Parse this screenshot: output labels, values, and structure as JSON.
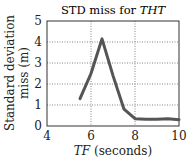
{
  "chart_data": {
    "type": "line",
    "title": "STD miss for THT",
    "title_plain": "STD miss for ",
    "title_italic": "THT",
    "xlabel": "TF (seconds)",
    "xlabel_italic": "TF",
    "xlabel_plain": " (seconds)",
    "ylabel_line1": "Standard deviation",
    "ylabel_line2": "miss (m)",
    "xlim": [
      4,
      10
    ],
    "ylim": [
      0,
      5
    ],
    "xticks": [
      4,
      6,
      8,
      10
    ],
    "yticks": [
      0,
      1,
      2,
      3,
      4,
      5
    ],
    "grid": true,
    "series": [
      {
        "name": "STD miss",
        "color": "#555555",
        "x": [
          5.5,
          6.0,
          6.5,
          7.0,
          7.5,
          8.0,
          8.5,
          9.0,
          9.5,
          10.0
        ],
        "y": [
          1.3,
          2.5,
          4.15,
          2.4,
          0.8,
          0.35,
          0.32,
          0.32,
          0.35,
          0.3
        ]
      }
    ]
  }
}
